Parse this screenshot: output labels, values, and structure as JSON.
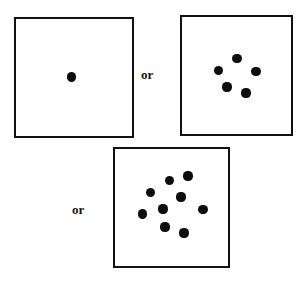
{
  "figure": {
    "name": "numerosity-comparison-figure",
    "background_color": "#ffffff",
    "width": 308,
    "height": 281,
    "dot_color": "#0d0d0d",
    "border_color": "#111111"
  },
  "connectors": [
    {
      "id": "or-1",
      "label": "or",
      "x": 141,
      "y": 68,
      "font_size": 13
    },
    {
      "id": "or-2",
      "label": "or",
      "x": 72,
      "y": 203,
      "font_size": 13
    }
  ],
  "panels": [
    {
      "id": "panel-one-dot",
      "name": "stimulus-box-1",
      "count": 1,
      "x": 14,
      "y": 17,
      "width": 120,
      "height": 121,
      "dot_radius": 4.6,
      "dots": [
        {
          "cx": 71.5,
          "cy": 77.0
        }
      ]
    },
    {
      "id": "panel-five-dots",
      "name": "stimulus-box-5",
      "count": 5,
      "x": 180,
      "y": 15,
      "width": 113,
      "height": 121,
      "dot_radius": 4.6,
      "dots": [
        {
          "cx": 237.0,
          "cy": 58.5
        },
        {
          "cx": 218.5,
          "cy": 70.5
        },
        {
          "cx": 256.0,
          "cy": 71.5
        },
        {
          "cx": 227.0,
          "cy": 87.0
        },
        {
          "cx": 246.0,
          "cy": 93.0
        }
      ]
    },
    {
      "id": "panel-nine-dots",
      "name": "stimulus-box-9",
      "count": 9,
      "x": 113,
      "y": 147,
      "width": 117,
      "height": 121,
      "dot_radius": 4.6,
      "dots": [
        {
          "cx": 169.5,
          "cy": 180.5
        },
        {
          "cx": 188.0,
          "cy": 176.0
        },
        {
          "cx": 150.5,
          "cy": 192.5
        },
        {
          "cx": 181.0,
          "cy": 197.0
        },
        {
          "cx": 163.0,
          "cy": 209.0
        },
        {
          "cx": 203.0,
          "cy": 209.5
        },
        {
          "cx": 142.5,
          "cy": 214.0
        },
        {
          "cx": 165.0,
          "cy": 227.0
        },
        {
          "cx": 184.0,
          "cy": 233.0
        }
      ]
    }
  ]
}
